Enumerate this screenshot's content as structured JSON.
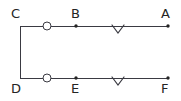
{
  "figure": {
    "kind": "geometry-diagram",
    "width": 181,
    "height": 101,
    "background_color": "#ffffff",
    "stroke_color": "#3a3a42",
    "label_color": "#242424",
    "stroke_width": 1,
    "labels": {
      "top_left": "C",
      "top_middle": "B",
      "top_right": "A",
      "bottom_left": "D",
      "bottom_middle": "E",
      "bottom_right": "F"
    },
    "geometry": {
      "top_line": {
        "x1": 20,
        "y1": 26,
        "x2": 169,
        "y2": 26
      },
      "bottom_line": {
        "x1": 20,
        "y1": 78,
        "x2": 169,
        "y2": 78
      },
      "vertical_line": {
        "x1": 20,
        "y1": 26,
        "x2": 20,
        "y2": 78
      },
      "top_circle": {
        "cx": 47,
        "cy": 26,
        "r": 4
      },
      "bottom_circle": {
        "cx": 47,
        "cy": 78,
        "r": 4
      },
      "top_point_b": {
        "cx": 76,
        "cy": 26,
        "r": 1.6
      },
      "bottom_point_e": {
        "cx": 76,
        "cy": 78,
        "r": 1.6
      },
      "top_point_a": {
        "cx": 168,
        "cy": 26,
        "r": 1.6
      },
      "bottom_point_f": {
        "cx": 168,
        "cy": 78,
        "r": 1.6
      },
      "top_chevron": {
        "cx": 118,
        "cy": 25,
        "half_width": 6,
        "depth": 8
      },
      "bottom_chevron": {
        "cx": 118,
        "cy": 77,
        "half_width": 6,
        "depth": 8
      }
    },
    "label_positions": {
      "top_left": {
        "x": 11,
        "y": 7
      },
      "top_middle": {
        "x": 71,
        "y": 7
      },
      "top_right": {
        "x": 161,
        "y": 7
      },
      "bottom_left": {
        "x": 11,
        "y": 82
      },
      "bottom_middle": {
        "x": 71,
        "y": 82
      },
      "bottom_right": {
        "x": 161,
        "y": 82
      }
    }
  }
}
